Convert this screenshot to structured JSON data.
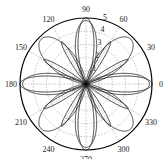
{
  "chart_data": {
    "type": "polar",
    "title": "",
    "center": [
      86,
      84
    ],
    "outer_radius_px": 66,
    "r_max": 5,
    "radial_ticks": [
      "1",
      "2",
      "3",
      "4",
      "5"
    ],
    "radial_tick_values": [
      1,
      2,
      3,
      4,
      5
    ],
    "angle_ticks": [
      "0",
      "30",
      "60",
      "90",
      "120",
      "150",
      "180",
      "210",
      "240",
      "270",
      "300",
      "330"
    ],
    "angle_tick_values": [
      0,
      30,
      60,
      90,
      120,
      150,
      180,
      210,
      240,
      270,
      300,
      330
    ],
    "grid": true,
    "series": [
      {
        "name": "narrow petals (0/90/180/270)",
        "formula": "r = 5*|cos(2θ)|^6",
        "amplitude": 5,
        "k": 2,
        "power": 6
      },
      {
        "name": "petals at 30/60 multiples",
        "formula": "r = 4*|cos(6θ)|^2 (off-axis)",
        "amplitude": 3.7,
        "k": 6,
        "power": 4,
        "skip_axes": true
      },
      {
        "name": "wide diagonal lobes",
        "formula": "r = 4.8*|sin(2θ)|^2",
        "amplitude": 4.8,
        "k": 2,
        "power": 2,
        "phase_deg": 45
      },
      {
        "name": "medium axis lobes",
        "formula": "r = 4.8*|cos(2θ)|^3",
        "amplitude": 4.8,
        "k": 2,
        "power": 3
      }
    ],
    "colors": {
      "curve": "#1a1a1a",
      "grid": "#888888",
      "axis": "#000000"
    }
  }
}
